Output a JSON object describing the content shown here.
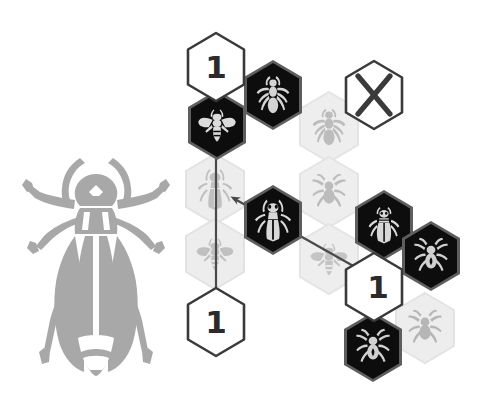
{
  "scene": {
    "title": "Insect hexagon tile board",
    "background_color": "#ffffff",
    "illustration": {
      "name": "longhorn-beetle-silhouette",
      "label": "Longhorn beetle silhouette",
      "color": "#a8a8a8"
    }
  },
  "colors": {
    "dark_tile": "#0d0d0d",
    "dark_tile_border": "#5a5a5a",
    "faded_tile": "#ededed",
    "faded_tile_glyph": "#c4c4c4",
    "marker_tile_fill": "#ffffff",
    "marker_tile_border": "#3a3a3a",
    "marker_text": "#2b2b2b",
    "arrow": "#4a4a4a",
    "dark_glyph": "#d8d8d8"
  },
  "markers": [
    {
      "id": "marker-top",
      "value": "1",
      "x": 183,
      "y": 30,
      "name": "count-marker-top"
    },
    {
      "id": "marker-bottom",
      "value": "1",
      "x": 183,
      "y": 285,
      "name": "count-marker-bottom"
    },
    {
      "id": "marker-right",
      "value": "1",
      "x": 341,
      "y": 250,
      "name": "count-marker-right"
    }
  ],
  "blocked": [
    {
      "id": "blocked-top-right",
      "symbol": "X",
      "x": 341,
      "y": 58,
      "name": "blocked-tile"
    }
  ],
  "tiles": [
    {
      "id": "t1",
      "creature": "bee",
      "state": "active",
      "x": 184,
      "y": 88,
      "name": "tile-bee-active"
    },
    {
      "id": "t2",
      "creature": "ant",
      "state": "active",
      "x": 240,
      "y": 58,
      "name": "tile-ant-active"
    },
    {
      "id": "t3",
      "creature": "ant",
      "state": "faded",
      "x": 296,
      "y": 90,
      "name": "tile-ant-faded"
    },
    {
      "id": "t4",
      "creature": "longhorn-beetle",
      "state": "faded",
      "x": 182,
      "y": 152,
      "name": "tile-longhorn-faded"
    },
    {
      "id": "t5",
      "creature": "longhorn-beetle",
      "state": "active",
      "x": 240,
      "y": 183,
      "name": "tile-longhorn-active"
    },
    {
      "id": "t6",
      "creature": "spider",
      "state": "faded",
      "x": 296,
      "y": 155,
      "name": "tile-spider-faded-upper"
    },
    {
      "id": "t7",
      "creature": "bee",
      "state": "faded",
      "x": 182,
      "y": 217,
      "name": "tile-bee-faded"
    },
    {
      "id": "t8",
      "creature": "bee",
      "state": "faded",
      "x": 296,
      "y": 222,
      "name": "tile-bee-faded-right"
    },
    {
      "id": "t9",
      "creature": "beetle",
      "state": "active",
      "x": 351,
      "y": 188,
      "name": "tile-beetle-active"
    },
    {
      "id": "t10",
      "creature": "spider",
      "state": "active",
      "x": 398,
      "y": 219,
      "name": "tile-spider-active-upper"
    },
    {
      "id": "t11",
      "creature": "spider",
      "state": "active",
      "x": 340,
      "y": 310,
      "name": "tile-spider-active-lower"
    },
    {
      "id": "t12",
      "creature": "spider",
      "state": "faded",
      "x": 392,
      "y": 291,
      "name": "tile-spider-faded-lower"
    }
  ],
  "arrows": [
    {
      "id": "arrow-vertical",
      "name": "arrow-vertical-bidirectional",
      "from": "marker-bottom",
      "to": "marker-top",
      "heads": "both",
      "x1": 216,
      "y1": 300,
      "x2": 216,
      "y2": 65
    },
    {
      "id": "arrow-diagonal",
      "name": "arrow-diagonal",
      "from": "tile-longhorn-faded",
      "to": "marker-right",
      "heads": "both",
      "x1": 232,
      "y1": 197,
      "x2": 372,
      "y2": 276
    }
  ],
  "legend": {
    "active_label": "Active tile",
    "faded_label": "Inactive tile",
    "marker_label": "Count marker",
    "blocked_label": "Blocked tile"
  }
}
